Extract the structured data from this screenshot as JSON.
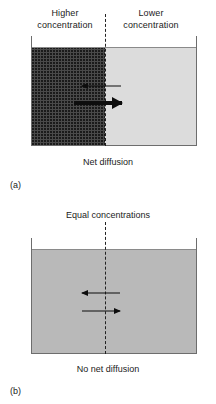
{
  "figure": {
    "panel_a": {
      "label": "(a)",
      "left_caption_line1": "Higher",
      "left_caption_line2": "concentration",
      "right_caption_line1": "Lower",
      "right_caption_line2": "concentration",
      "bottom_label": "Net diffusion",
      "arrows": [
        {
          "name": "backward-flux-arrow",
          "direction": "left",
          "weight": "thin"
        },
        {
          "name": "net-diffusion-arrow",
          "direction": "right",
          "weight": "thick"
        }
      ],
      "left_region_fill": "#4a4a4a",
      "right_region_fill": "#dcdcdc",
      "divider_style": "dashed"
    },
    "panel_b": {
      "label": "(b)",
      "top_caption": "Equal concentrations",
      "bottom_label": "No net diffusion",
      "arrows": [
        {
          "name": "leftward-flux-arrow",
          "direction": "left",
          "weight": "thin"
        },
        {
          "name": "rightward-flux-arrow",
          "direction": "right",
          "weight": "thin"
        }
      ],
      "region_fill": "#b9b9b9",
      "divider_style": "dashed"
    },
    "colors": {
      "ink": "#1b1b1b",
      "arrow": "#0d0d0d",
      "vessel_wall": "#6d6d6d"
    }
  }
}
